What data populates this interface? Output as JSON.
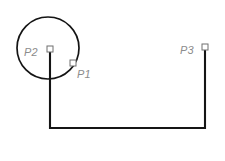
{
  "figure": {
    "background_color": "#ffffff",
    "width": 225,
    "height": 161
  },
  "style": {
    "path_color": "#151515",
    "circle_color": "#141414",
    "label_color": "#8c8c8c",
    "marker_fill": "#ffffff",
    "marker_stroke": "#6f6f6f",
    "path_stroke_width": 2.1,
    "circle_stroke_width": 1.7
  },
  "circle": {
    "name": "construction-circle",
    "center_x": 48,
    "center_y": 48,
    "radius": 31
  },
  "points": [
    {
      "id": "p1",
      "label": "P1",
      "marker_x": 73,
      "marker_y": 63,
      "marker_size": 6,
      "label_x": 77,
      "label_y": 78
    },
    {
      "id": "p2",
      "label": "P2",
      "marker_x": 50,
      "marker_y": 49,
      "marker_size": 6,
      "label_x": 24,
      "label_y": 56
    },
    {
      "id": "p3",
      "label": "P3",
      "marker_x": 205,
      "marker_y": 47,
      "marker_size": 6,
      "label_x": 180,
      "label_y": 54
    }
  ],
  "polyline": {
    "name": "u-shaped-path",
    "description": "Vertical line down from P2, horizontal across the bottom, vertical up to P3",
    "vertices": [
      {
        "x": 50,
        "y": 49
      },
      {
        "x": 50,
        "y": 128
      },
      {
        "x": 205,
        "y": 128
      },
      {
        "x": 205,
        "y": 47
      }
    ],
    "path_d": "M 50 49 L 50 128 L 205 128 L 205 47"
  }
}
